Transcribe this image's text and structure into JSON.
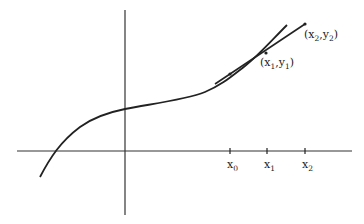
{
  "figure": {
    "x_ticks": [
      {
        "label": "x",
        "sub": "0"
      },
      {
        "label": "x",
        "sub": "1"
      },
      {
        "label": "x",
        "sub": "2"
      }
    ],
    "points": [
      {
        "label_open": "(x",
        "sub_a": "1",
        "mid": ",y",
        "sub_b": "1",
        "close": ")"
      },
      {
        "label_open": "(x",
        "sub_a": "2",
        "mid": ",y",
        "sub_b": "2",
        "close": ")"
      }
    ],
    "colors": {
      "ink": "#222222",
      "background": "#ffffff"
    }
  }
}
